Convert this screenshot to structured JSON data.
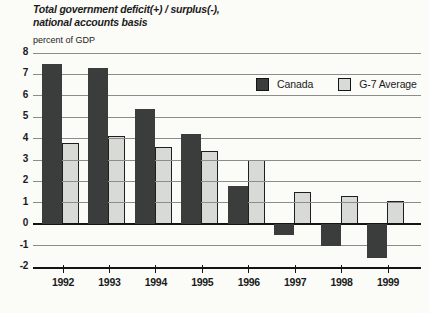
{
  "title": {
    "line1": "Total government deficit(+) / surplus(-),",
    "line2": "national accounts basis",
    "unit_label": "percent of GDP"
  },
  "legend": [
    {
      "label": "Canada",
      "color": "#3b3d3c"
    },
    {
      "label": "G-7 Average",
      "color": "#d8dad6"
    }
  ],
  "chart_data": {
    "type": "bar",
    "title": "Total government deficit(+) / surplus(-), national accounts basis",
    "xlabel": "",
    "ylabel": "percent of GDP",
    "categories": [
      "1992",
      "1993",
      "1994",
      "1995",
      "1996",
      "1997",
      "1998",
      "1999"
    ],
    "series": [
      {
        "name": "Canada",
        "color": "#3b3d3c",
        "values": [
          7.5,
          7.3,
          5.4,
          4.2,
          1.8,
          -0.5,
          -1.0,
          -1.6
        ]
      },
      {
        "name": "G-7 Average",
        "color": "#d8dad6",
        "values": [
          3.8,
          4.1,
          3.6,
          3.4,
          3.0,
          1.5,
          1.3,
          1.1
        ]
      }
    ],
    "ylim": [
      -2,
      8
    ],
    "yticks": [
      8,
      7,
      6,
      5,
      4,
      3,
      2,
      1,
      0,
      -1,
      -2
    ],
    "grid": true,
    "gridlines_over_light_bars": true,
    "legend_position": "top-right"
  }
}
